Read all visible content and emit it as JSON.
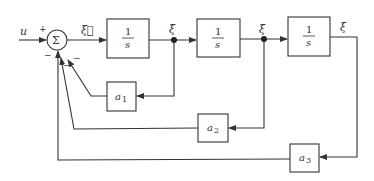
{
  "diagram": {
    "type": "block-diagram",
    "title": "",
    "input": {
      "label": "u"
    },
    "sum": {
      "symbol": "Σ",
      "signs": {
        "input": "+",
        "fb1": "−",
        "fb2": "−",
        "fb3": "−"
      }
    },
    "integrators": [
      {
        "id": "int1",
        "numerator": "1",
        "denominator": "s",
        "output_label": "ξ⃛"
      },
      {
        "id": "int2",
        "numerator": "1",
        "denominator": "s",
        "output_label": "ξ̈"
      },
      {
        "id": "int3",
        "numerator": "1",
        "denominator": "s",
        "output_label": "ξ"
      }
    ],
    "signal_labels": {
      "after_sum": "ξ⃛",
      "after_int1": "ξ̈",
      "after_int2": "ξ̇",
      "after_int3": "ξ"
    },
    "gains": [
      {
        "id": "a1",
        "base": "a",
        "sub": "1"
      },
      {
        "id": "a2",
        "base": "a",
        "sub": "2"
      },
      {
        "id": "a3",
        "base": "a",
        "sub": "3"
      }
    ],
    "colors": {
      "line": "#333333",
      "background": "#ffffff"
    }
  }
}
